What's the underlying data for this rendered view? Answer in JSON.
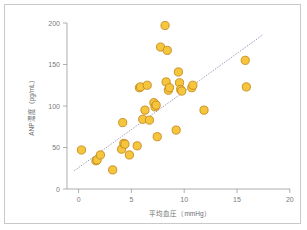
{
  "figure": {
    "background_color": "#ffffff",
    "frame_color": "#c9c9c9",
    "marker_fill": "#f5c63c",
    "marker_stroke": "#c58a22",
    "fitline_color": "#8f8fb3",
    "axis_color": "#9a9a9a"
  },
  "chart_data": {
    "type": "scatter",
    "title": "",
    "xlabel": "平均血圧（mmHg）",
    "ylabel": "ANP濃度（pg/mL）",
    "xlim": [
      0,
      20
    ],
    "ylim": [
      0,
      200
    ],
    "xticks": [
      0,
      5,
      10,
      15,
      20
    ],
    "yticks": [
      0,
      50,
      100,
      150,
      200
    ],
    "xtick_labels": [
      "0",
      "5",
      "10",
      "15",
      "20"
    ],
    "ytick_labels": [
      "0",
      "50",
      "100",
      "150",
      "200"
    ],
    "grid": false,
    "legend": null,
    "series": [
      {
        "name": "patients",
        "marker": "circle",
        "x": [
          1.3,
          2.6,
          2.7,
          3.0,
          4.1,
          4.9,
          5.0,
          5.1,
          5.2,
          5.6,
          6.3,
          6.5,
          6.6,
          6.8,
          7.0,
          7.2,
          7.4,
          7.8,
          7.9,
          8.0,
          8.1,
          8.4,
          8.8,
          8.9,
          9.0,
          9.1,
          9.2,
          9.8,
          10.0,
          10.1,
          10.2,
          10.3,
          11.2,
          11.3,
          12.3,
          16.0,
          16.1
        ],
        "y": [
          47,
          34,
          35,
          41,
          23,
          48,
          80,
          55,
          54,
          41,
          52,
          122,
          123,
          84,
          95,
          125,
          83,
          104,
          99,
          101,
          63,
          171,
          197,
          129,
          167,
          119,
          122,
          71,
          141,
          128,
          120,
          118,
          122,
          125,
          95,
          155,
          123
        ]
      }
    ],
    "trendline": {
      "type": "linear-fit",
      "style": "dotted",
      "x_start": 0.65,
      "y_start": 22,
      "x_end": 17.6,
      "y_end": 186
    }
  }
}
